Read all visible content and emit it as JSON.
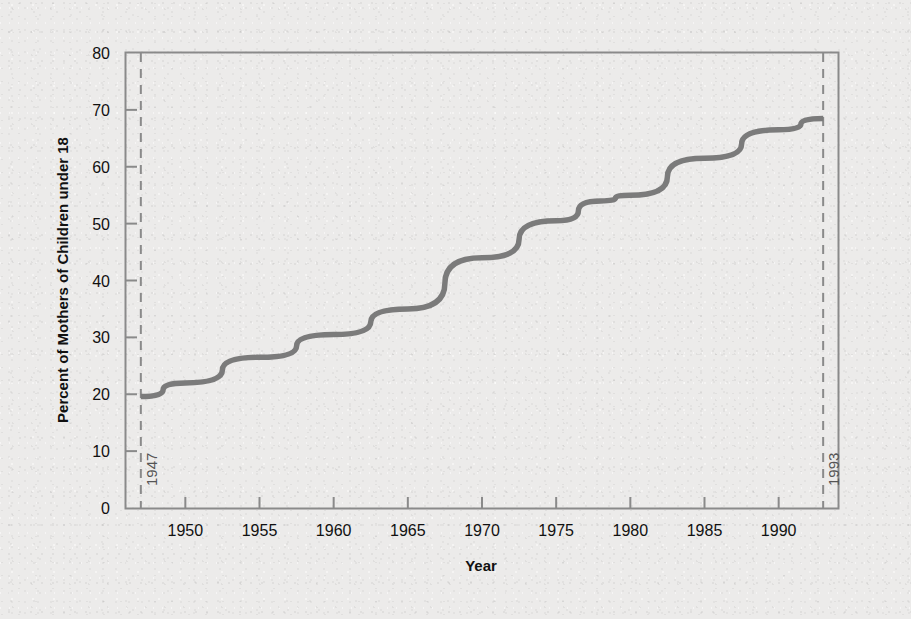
{
  "chart_data": {
    "type": "line",
    "title": "",
    "xlabel": "Year",
    "ylabel": "Percent of Mothers of Children under 18",
    "xlim": [
      1946,
      1994
    ],
    "ylim": [
      0,
      80
    ],
    "grid": false,
    "legend": "none",
    "line_color": "#7b7b7b",
    "xticks": [
      1950,
      1955,
      1960,
      1965,
      1970,
      1975,
      1980,
      1985,
      1990
    ],
    "xtick_labels": [
      "1950",
      "1955",
      "1960",
      "1965",
      "1970",
      "1975",
      "1980",
      "1985",
      "1990"
    ],
    "yticks": [
      0,
      10,
      20,
      30,
      40,
      50,
      60,
      70,
      80
    ],
    "ytick_labels": [
      "0",
      "10",
      "20",
      "30",
      "40",
      "50",
      "60",
      "70",
      "80"
    ],
    "series": [
      {
        "name": "Percent of mothers of children under 18 in labor force",
        "x": [
          1947,
          1950,
          1955,
          1960,
          1965,
          1970,
          1975,
          1978,
          1980,
          1985,
          1990,
          1993
        ],
        "values": [
          19.6,
          22.0,
          26.5,
          30.5,
          35.0,
          44.0,
          50.5,
          54.0,
          55.0,
          61.5,
          66.5,
          68.5
        ]
      }
    ],
    "annotations": [
      {
        "name": "start-marker",
        "type": "vertical-dashed-line",
        "x": 1947,
        "label": "1947",
        "orientation": "vertical-text",
        "color": "#8a8a8a"
      },
      {
        "name": "end-marker",
        "type": "vertical-dashed-line",
        "x": 1993,
        "label": "1993",
        "orientation": "vertical-text",
        "color": "#8a8a8a"
      }
    ]
  },
  "axis": {
    "y_title": "Percent of Mothers of Children under 18",
    "x_title": "Year"
  },
  "colors": {
    "background": "#ecebea",
    "frame": "#8a8a8a",
    "line": "#7b7b7b",
    "dashed": "#8a8a8a",
    "text": "#111111"
  }
}
